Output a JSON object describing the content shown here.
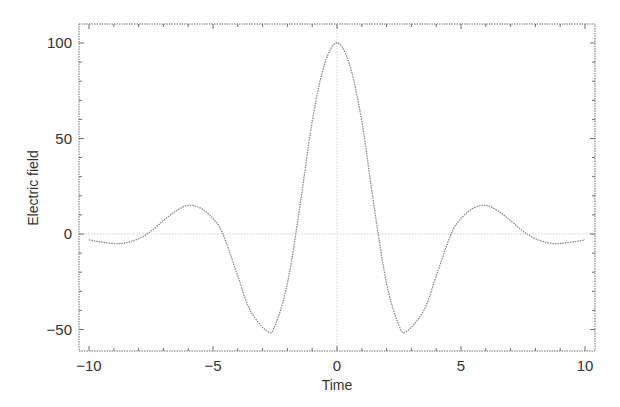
{
  "chart_data": {
    "type": "line",
    "title": "",
    "xlabel": "Time",
    "ylabel": "Electric field",
    "xlim": [
      -10.4,
      10.4
    ],
    "ylim": [
      -60,
      110
    ],
    "xticks": [
      -10,
      -5,
      0,
      5,
      10
    ],
    "xtick_labels": [
      "−10",
      "−5",
      "0",
      "5",
      "10"
    ],
    "yticks": [
      -50,
      0,
      50,
      100
    ],
    "ytick_labels": [
      "−50",
      "0",
      "50",
      "100"
    ],
    "grid": false,
    "legend": null,
    "reference_lines": [
      {
        "axis": "y",
        "value": 0,
        "style": "dotted"
      },
      {
        "axis": "x",
        "value": 0,
        "style": "dotted"
      }
    ],
    "series": [
      {
        "name": "Electric field",
        "style": "dotted",
        "color": "#8a8a8a",
        "x": [
          -10,
          -9.5,
          -8.7,
          -8,
          -7.5,
          -7,
          -6.5,
          -6,
          -5.5,
          -5,
          -4.6,
          -4,
          -3.5,
          -2.8,
          -2.5,
          -2,
          -1.5,
          -1,
          -0.5,
          0,
          0.5,
          1,
          1.5,
          2,
          2.5,
          2.8,
          3.5,
          4,
          4.6,
          5,
          5.5,
          6,
          6.5,
          7,
          7.5,
          8,
          8.7,
          9.5,
          10
        ],
        "y": [
          -3,
          -4.2,
          -5,
          -2.5,
          1.5,
          7,
          12,
          15,
          13.5,
          8,
          0,
          -22,
          -40,
          -51,
          -48,
          -26,
          14,
          59,
          89,
          100,
          89,
          59,
          14,
          -26,
          -48,
          -51,
          -40,
          -22,
          0,
          8,
          13.5,
          15,
          12,
          7,
          1.5,
          -2.5,
          -5,
          -4.2,
          -3
        ]
      }
    ]
  },
  "colors": {
    "axis": "#6f6f6f",
    "curve": "#8a8a8a",
    "zero_line": "#c8c8c8",
    "text": "#333333"
  }
}
